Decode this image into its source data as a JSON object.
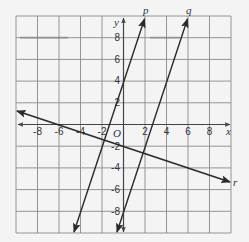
{
  "figure": {
    "type": "coordinate-plane",
    "axis_labels": {
      "x": "x",
      "y": "y",
      "origin": "O"
    },
    "x_range": [
      -10,
      10
    ],
    "y_range": [
      -10,
      10
    ],
    "grid_step": 2,
    "x_tick_labels": [
      "-8",
      "-6",
      "-4",
      "-2",
      "2",
      "4",
      "6",
      "8"
    ],
    "y_tick_labels": [
      "8",
      "6",
      "4",
      "2",
      "-2",
      "-4",
      "-6",
      "-8"
    ],
    "lines": [
      {
        "name": "p",
        "equation": "y = 3x + 4",
        "slope": 3,
        "intercept": 4
      },
      {
        "name": "q",
        "equation": "y = 3x - 8",
        "slope": 3,
        "intercept": -8
      },
      {
        "name": "r",
        "equation": "y = -x/3 - 2",
        "slope": -0.3333,
        "intercept": -2
      }
    ],
    "colors": {
      "grid": "#8a8a8a",
      "axis": "#444444",
      "line": "#2a2a2a",
      "background": "#f4f4f4"
    }
  }
}
